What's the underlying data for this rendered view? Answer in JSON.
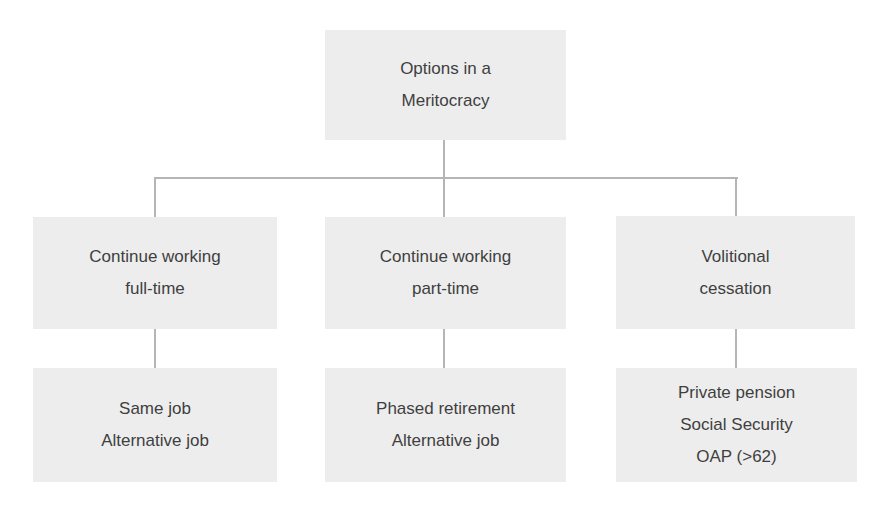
{
  "root": {
    "lines": [
      "Options in a",
      "Meritocracy"
    ]
  },
  "level2": [
    {
      "lines": [
        "Continue working",
        "full-time"
      ]
    },
    {
      "lines": [
        "Continue working",
        "part-time"
      ]
    },
    {
      "lines": [
        "Volitional",
        "cessation"
      ]
    }
  ],
  "level3": [
    {
      "lines": [
        "Same job",
        "Alternative job"
      ]
    },
    {
      "lines": [
        "Phased retirement",
        "Alternative job"
      ]
    },
    {
      "lines": [
        "Private pension",
        "Social Security",
        "OAP (>62)"
      ]
    }
  ],
  "colors": {
    "box_fill": "#ededed",
    "connector": "#b5b5b5",
    "text": "#3f3f3f"
  }
}
